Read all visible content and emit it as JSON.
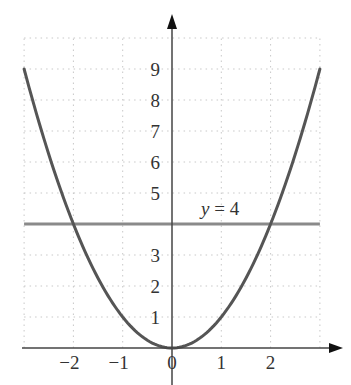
{
  "chart_data": {
    "type": "line",
    "title": "",
    "xlabel": "",
    "ylabel": "",
    "xlim": [
      -3,
      3
    ],
    "ylim": [
      0,
      10
    ],
    "grid": true,
    "legend": null,
    "x_ticks": [
      {
        "value": -2,
        "label": "−2"
      },
      {
        "value": -1,
        "label": "−1"
      },
      {
        "value": 0,
        "label": "0"
      },
      {
        "value": 1,
        "label": "1"
      },
      {
        "value": 2,
        "label": "2"
      }
    ],
    "y_ticks": [
      {
        "value": 1,
        "label": "1"
      },
      {
        "value": 2,
        "label": "2"
      },
      {
        "value": 3,
        "label": "3"
      },
      {
        "value": 5,
        "label": "5"
      },
      {
        "value": 6,
        "label": "6"
      },
      {
        "value": 7,
        "label": "7"
      },
      {
        "value": 8,
        "label": "8"
      },
      {
        "value": 9,
        "label": "9"
      }
    ],
    "series": [
      {
        "name": "y = x^2",
        "color": "#555555",
        "x": [
          -3,
          -2.5,
          -2,
          -1.5,
          -1,
          -0.5,
          0,
          0.5,
          1,
          1.5,
          2,
          2.5,
          3
        ],
        "y": [
          9,
          6.25,
          4,
          2.25,
          1,
          0.25,
          0,
          0.25,
          1,
          2.25,
          4,
          6.25,
          9
        ]
      },
      {
        "name": "y = 4",
        "color": "#888888",
        "x": [
          -3,
          3
        ],
        "y": [
          4,
          4
        ]
      }
    ],
    "annotations": [
      {
        "text_var": "y",
        "text_rest": " = 4",
        "x": 0.6,
        "y": 4.3
      }
    ]
  },
  "colors": {
    "curve": "#555555",
    "hline": "#8a8a8a",
    "axis": "#444444",
    "grid": "#c8c8c8",
    "text": "#333333"
  }
}
